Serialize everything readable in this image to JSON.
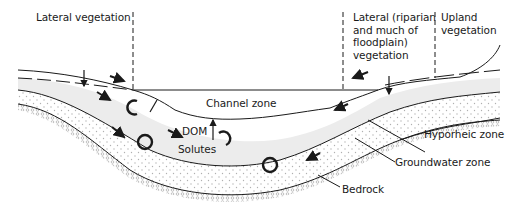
{
  "diagram": {
    "colors": {
      "line": "#1a1a1a",
      "hyporheic_fill": "#ececec",
      "groundwater_dots": "#b5b5b5",
      "bedrock_pattern": "#9a9a9a",
      "background": "#ffffff"
    },
    "labels": {
      "lateral_vegetation": "Lateral vegetation",
      "lateral_riparian": "Lateral (riparian\nand much of\nfloodplain)\nvegetation",
      "upland_vegetation": "Upland\nvegetation",
      "channel_zone": "Channel zone",
      "dom": "DOM",
      "solutes": "Solutes",
      "hyporheic_zone": "Hyporheic zone",
      "groundwater_zone": "Groundwater zone",
      "bedrock": "Bedrock"
    },
    "icons": [
      "flow-arrow-icon",
      "circulation-loop-icon",
      "vertical-exchange-arrow-icon",
      "dashed-boundary-line"
    ]
  }
}
